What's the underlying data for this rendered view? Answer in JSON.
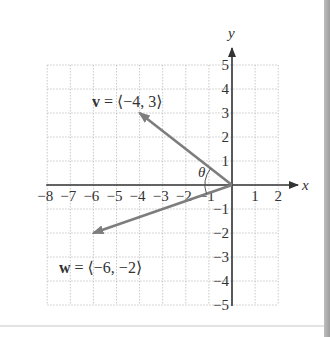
{
  "figure": {
    "axes": {
      "x_label": "x",
      "y_label": "y",
      "x_ticks": [
        "−8",
        "−7",
        "−6",
        "−5",
        "−4",
        "−3",
        "−2",
        "−1",
        "1",
        "2"
      ],
      "x_tick_values": [
        -8,
        -7,
        -6,
        -5,
        -4,
        -3,
        -2,
        -1,
        1,
        2
      ],
      "y_ticks": [
        "5",
        "4",
        "3",
        "2",
        "1",
        "−1",
        "−2",
        "−3",
        "−4",
        "−5"
      ],
      "y_tick_values": [
        5,
        4,
        3,
        2,
        1,
        -1,
        -2,
        -3,
        -4,
        -5
      ],
      "xlim": [
        -8,
        2
      ],
      "ylim": [
        -5,
        5
      ],
      "grid": "dotted"
    },
    "vectors": [
      {
        "name": "v",
        "label_bold": "v",
        "label_rest": " = ⟨−4, 3⟩",
        "x": -4,
        "y": 3
      },
      {
        "name": "w",
        "label_bold": "w",
        "label_rest": " = ⟨−6, −2⟩",
        "x": -6,
        "y": -2
      }
    ],
    "angle_label": "θ",
    "colors": {
      "vector": "#7d7d7d",
      "axis": "#333333",
      "grid": "#c8c8c8"
    }
  }
}
